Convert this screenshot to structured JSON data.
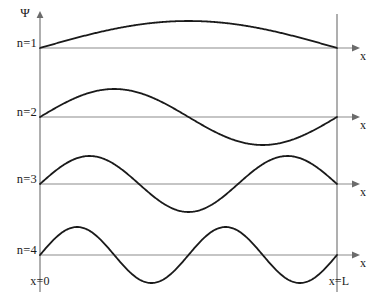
{
  "figure": {
    "vertical_axis_label": "Ψ",
    "horizontal_axis_label": "x",
    "boundary_left_label": "x=0",
    "boundary_right_label": "x=L",
    "colors": {
      "curve": "#1a1a1a",
      "baseline": "#8c8c8c",
      "wall": "#7a7a7a",
      "background": "#ffffff",
      "text": "#1a1a1a"
    }
  },
  "levels": [
    {
      "label": "n=1",
      "n": 1,
      "half_periods": 1,
      "nodes_interior": 0
    },
    {
      "label": "n=2",
      "n": 2,
      "half_periods": 2,
      "nodes_interior": 1
    },
    {
      "label": "n=3",
      "n": 3,
      "half_periods": 3,
      "nodes_interior": 2
    },
    {
      "label": "n=4",
      "n": 4,
      "half_periods": 4,
      "nodes_interior": 3
    }
  ],
  "chart_data": {
    "type": "line",
    "xlabel": "x",
    "ylabel": "Ψ",
    "grid": false,
    "legend": "inline-left",
    "x_domain": [
      0,
      1
    ],
    "x_tick_labels": [
      "x=0",
      "x=L"
    ],
    "box_left_px": 40,
    "box_right_px": 337,
    "series": [
      {
        "name": "n=1",
        "baseline_px": 48,
        "amplitude_px": 27,
        "formula": "sin(1*pi*x/L)",
        "samples_x": [
          0,
          0.125,
          0.25,
          0.375,
          0.5,
          0.625,
          0.75,
          0.875,
          1
        ],
        "samples_y": [
          0,
          0.383,
          0.707,
          0.924,
          1,
          0.924,
          0.707,
          0.383,
          0
        ]
      },
      {
        "name": "n=2",
        "baseline_px": 117,
        "amplitude_px": 28,
        "formula": "sin(2*pi*x/L)",
        "samples_x": [
          0,
          0.125,
          0.25,
          0.375,
          0.5,
          0.625,
          0.75,
          0.875,
          1
        ],
        "samples_y": [
          0,
          0.707,
          1,
          0.707,
          0,
          -0.707,
          -1,
          -0.707,
          0
        ]
      },
      {
        "name": "n=3",
        "baseline_px": 184,
        "amplitude_px": 28,
        "formula": "sin(3*pi*x/L)",
        "samples_x": [
          0,
          0.0833,
          0.1667,
          0.3333,
          0.5,
          0.6667,
          0.8333,
          0.9167,
          1
        ],
        "samples_y": [
          0,
          0.707,
          1,
          0,
          -1,
          0,
          1,
          0.707,
          0
        ]
      },
      {
        "name": "n=4",
        "baseline_px": 255,
        "amplitude_px": 28,
        "formula": "sin(4*pi*x/L)",
        "samples_x": [
          0,
          0.0625,
          0.125,
          0.25,
          0.375,
          0.5,
          0.625,
          0.75,
          0.875,
          0.9375,
          1
        ],
        "samples_y": [
          0,
          0.707,
          1,
          0,
          -1,
          0,
          1,
          0,
          -1,
          -0.707,
          0
        ]
      }
    ]
  }
}
